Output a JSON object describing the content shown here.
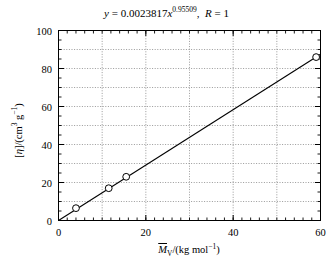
{
  "chart_data": {
    "type": "scatter",
    "title_parts": {
      "y_symbol": "y",
      "equals": "=",
      "coefficient": "0.0023817",
      "x_symbol": "x",
      "exponent": "0.95509",
      "comma": ",",
      "r_symbol": "R",
      "equals2": "=",
      "r_value": "1"
    },
    "xlabel": "M̄V/(kg mol⁻¹)",
    "xlabel_parts": {
      "m_symbol": "M",
      "subscript": "V",
      "slash_unit": "/(kg mol",
      "unit_exponent": "−1",
      "close": ")"
    },
    "ylabel": "[η]/(cm³ g⁻¹)",
    "ylabel_parts": {
      "bracket_open": "[",
      "eta": "η",
      "bracket_close": "]",
      "slash_unit": "/(cm",
      "cm_exponent": "3",
      "g_symbol": " g",
      "g_exponent": "−1",
      "close": ")"
    },
    "xlim": [
      0,
      60
    ],
    "ylim": [
      0,
      100
    ],
    "xticks": [
      0,
      20,
      40,
      60
    ],
    "yticks": [
      0,
      20,
      40,
      60,
      80,
      100
    ],
    "xtick_labels": [
      "0",
      "20",
      "40",
      "60"
    ],
    "ytick_labels": [
      "0",
      "20",
      "40",
      "60",
      "80",
      "100"
    ],
    "x_minor_step": 2,
    "y_minor_step": 5,
    "x_gridlines": [
      10,
      20,
      30,
      40,
      50
    ],
    "y_gridlines": [
      10,
      20,
      30,
      40,
      50,
      60,
      70,
      80,
      90
    ],
    "grid": true,
    "grid_style": "dotted",
    "legend": null,
    "marker": "open-circle",
    "points": [
      {
        "x": 4.0,
        "y": 6.5
      },
      {
        "x": 11.5,
        "y": 17.0
      },
      {
        "x": 15.5,
        "y": 23.0
      },
      {
        "x": 59.0,
        "y": 86.0
      }
    ],
    "fit_line": {
      "type": "power",
      "coefficient": 0.0023817,
      "exponent": 0.95509,
      "note": "line drawn from origin region through data points",
      "endpoints": [
        {
          "x": 0.0,
          "y": 0.0
        },
        {
          "x": 60.0,
          "y": 87.5
        }
      ]
    },
    "colors": {
      "axis": "#000000",
      "line": "#000000",
      "marker_edge": "#000000",
      "marker_face": "#ffffff",
      "grid": "#808080",
      "background": "#ffffff"
    }
  }
}
